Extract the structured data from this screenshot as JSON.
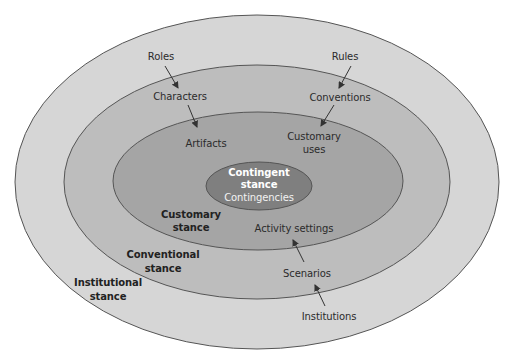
{
  "diagram": {
    "layers": [
      {
        "id": "institutional",
        "stance": "Institutional stance",
        "stance_line1": "Institutional",
        "stance_line2": "stance",
        "fill": "#d6d6d6",
        "stroke": "#555555"
      },
      {
        "id": "conventional",
        "stance": "Conventional stance",
        "stance_line1": "Conventional",
        "stance_line2": "stance",
        "fill": "#bdbdbd",
        "stroke": "#555555"
      },
      {
        "id": "customary",
        "stance": "Customary stance",
        "stance_line1": "Customary",
        "stance_line2": "stance",
        "fill": "#a5a5a5",
        "stroke": "#555555"
      },
      {
        "id": "contingent",
        "stance": "Contingent stance",
        "stance_line1": "Contingent",
        "stance_line2": "stance",
        "fill": "#7f7f7f",
        "stroke": "#555555"
      }
    ],
    "contingent_item": "Contingencies",
    "left_chain": {
      "roles": "Roles",
      "characters": "Characters",
      "artifacts": "Artifacts"
    },
    "right_chain": {
      "rules": "Rules",
      "conventions": "Conventions",
      "customary_uses_line1": "Customary",
      "customary_uses_line2": "uses"
    },
    "bottom_chain": {
      "activity_settings": "Activity settings",
      "scenarios": "Scenarios",
      "institutions": "Institutions"
    },
    "arrows": [
      {
        "from": "Roles",
        "to": "Characters"
      },
      {
        "from": "Characters",
        "to": "Artifacts"
      },
      {
        "from": "Rules",
        "to": "Conventions"
      },
      {
        "from": "Conventions",
        "to": "Customary uses"
      },
      {
        "from": "Institutions",
        "to": "Scenarios"
      },
      {
        "from": "Scenarios",
        "to": "Activity settings"
      }
    ],
    "text_color": "#2b2b2b",
    "arrow_color": "#333333"
  }
}
